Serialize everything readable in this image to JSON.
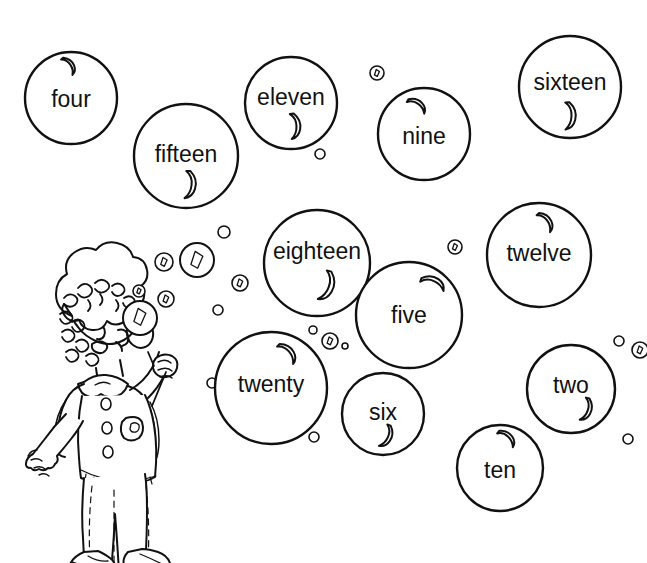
{
  "illustration": {
    "title": "Number word bubbles coloring page",
    "style": "black-and-white line art",
    "line_color": "#111111",
    "background_color": "#ffffff",
    "character": {
      "name": "girl-blowing-bubbles",
      "description": "girl with curly hair holding a bubble wand"
    }
  },
  "bubbles": [
    {
      "label": "four",
      "cx": 71,
      "cy": 98,
      "r": 46,
      "font_size": 23,
      "text_dy": 3,
      "shine": {
        "x": 71,
        "y": 65,
        "rot": -18,
        "scale": 0.55
      }
    },
    {
      "label": "fifteen",
      "cx": 186,
      "cy": 156,
      "r": 52,
      "font_size": 23,
      "text_dy": 0,
      "shine": {
        "x": 192,
        "y": 186,
        "rot": 22,
        "scale": 0.78
      }
    },
    {
      "label": "eleven",
      "cx": 291,
      "cy": 103,
      "r": 46,
      "font_size": 23,
      "text_dy": -4,
      "shine": {
        "x": 297,
        "y": 127,
        "rot": 14,
        "scale": 0.72
      }
    },
    {
      "label": "nine",
      "cx": 424,
      "cy": 134,
      "r": 46,
      "font_size": 23,
      "text_dy": 4,
      "shine": {
        "x": 419,
        "y": 104,
        "rot": -38,
        "scale": 0.6
      }
    },
    {
      "label": "sixteen",
      "cx": 570,
      "cy": 87,
      "r": 51,
      "font_size": 23,
      "text_dy": -3,
      "shine": {
        "x": 572,
        "y": 117,
        "rot": 18,
        "scale": 0.78
      }
    },
    {
      "label": "eighteen",
      "cx": 317,
      "cy": 263,
      "r": 53,
      "font_size": 23,
      "text_dy": -10,
      "shine": {
        "x": 329,
        "y": 288,
        "rot": 36,
        "scale": 0.86
      }
    },
    {
      "label": "twelve",
      "cx": 539,
      "cy": 255,
      "r": 52,
      "font_size": 23,
      "text_dy": 0,
      "shine": {
        "x": 548,
        "y": 221,
        "rot": -20,
        "scale": 0.62
      }
    },
    {
      "label": "five",
      "cx": 409,
      "cy": 315,
      "r": 53,
      "font_size": 23,
      "text_dy": 2,
      "shine": {
        "x": 435,
        "y": 281,
        "rot": -50,
        "scale": 0.72
      }
    },
    {
      "label": "twenty",
      "cx": 271,
      "cy": 388,
      "r": 56,
      "font_size": 23,
      "text_dy": -2,
      "shine": {
        "x": 290,
        "y": 352,
        "rot": -24,
        "scale": 0.68
      }
    },
    {
      "label": "six",
      "cx": 383,
      "cy": 414,
      "r": 41,
      "font_size": 23,
      "text_dy": 0,
      "shine": {
        "x": 388,
        "y": 438,
        "rot": 40,
        "scale": 0.66
      }
    },
    {
      "label": "two",
      "cx": 571,
      "cy": 389,
      "r": 44,
      "font_size": 23,
      "text_dy": -2,
      "shine": {
        "x": 588,
        "y": 411,
        "rot": 34,
        "scale": 0.66
      }
    },
    {
      "label": "ten",
      "cx": 500,
      "cy": 468,
      "r": 43,
      "font_size": 23,
      "text_dy": 4,
      "shine": {
        "x": 509,
        "y": 437,
        "rot": -30,
        "scale": 0.6
      }
    }
  ],
  "small_bubbles": [
    {
      "cx": 197,
      "cy": 260,
      "r": 17,
      "mark": "slit"
    },
    {
      "cx": 164,
      "cy": 262,
      "r": 9,
      "mark": "slit"
    },
    {
      "cx": 224,
      "cy": 232,
      "r": 6,
      "mark": "none"
    },
    {
      "cx": 166,
      "cy": 299,
      "r": 8,
      "mark": "slit"
    },
    {
      "cx": 139,
      "cy": 291,
      "r": 6,
      "mark": "slit"
    },
    {
      "cx": 240,
      "cy": 283,
      "r": 8,
      "mark": "slit"
    },
    {
      "cx": 218,
      "cy": 310,
      "r": 5,
      "mark": "none"
    },
    {
      "cx": 320,
      "cy": 154,
      "r": 5,
      "mark": "none"
    },
    {
      "cx": 377,
      "cy": 73,
      "r": 7,
      "mark": "slit"
    },
    {
      "cx": 455,
      "cy": 247,
      "r": 7,
      "mark": "slit"
    },
    {
      "cx": 330,
      "cy": 341,
      "r": 8,
      "mark": "slit"
    },
    {
      "cx": 313,
      "cy": 330,
      "r": 4,
      "mark": "none"
    },
    {
      "cx": 345,
      "cy": 346,
      "r": 3,
      "mark": "none"
    },
    {
      "cx": 212,
      "cy": 383,
      "r": 5,
      "mark": "none"
    },
    {
      "cx": 314,
      "cy": 437,
      "r": 5,
      "mark": "none"
    },
    {
      "cx": 619,
      "cy": 341,
      "r": 5,
      "mark": "none"
    },
    {
      "cx": 640,
      "cy": 350,
      "r": 8,
      "mark": "slit"
    },
    {
      "cx": 628,
      "cy": 439,
      "r": 5,
      "mark": "none"
    }
  ],
  "wand_bubble": {
    "cx": 140,
    "cy": 318,
    "r": 17
  }
}
